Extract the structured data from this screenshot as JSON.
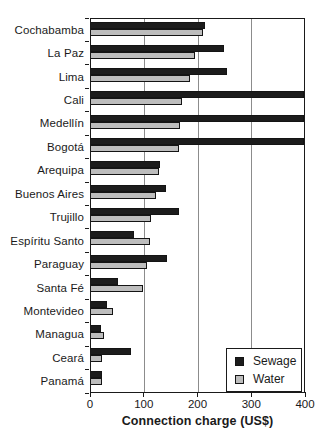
{
  "chart_data": {
    "type": "bar",
    "orientation": "horizontal",
    "title": "",
    "xlabel": "Connection charge (US$)",
    "ylabel": "",
    "xlim": [
      0,
      400
    ],
    "xticks": [
      0,
      100,
      200,
      300,
      400
    ],
    "grid": "vertical",
    "legend_position": "inside-bottom-right",
    "categories": [
      "Cochabamba",
      "La Paz",
      "Lima",
      "Cali",
      "Medellín",
      "Bogotá",
      "Arequipa",
      "Buenos Aires",
      "Trujillo",
      "Espíritu Santo",
      "Paraguay",
      "Santa Fé",
      "Montevideo",
      "Managua",
      "Ceará",
      "Panamá"
    ],
    "series": [
      {
        "name": "Sewage",
        "color": "#1c1c1c",
        "values": [
          215,
          250,
          255,
          400,
          400,
          400,
          130,
          140,
          165,
          80,
          143,
          50,
          30,
          18,
          75,
          20
        ]
      },
      {
        "name": "Water",
        "color": "#bdbdbd",
        "values": [
          210,
          195,
          185,
          170,
          168,
          165,
          128,
          122,
          113,
          110,
          105,
          98,
          42,
          25,
          20,
          20
        ]
      }
    ]
  },
  "legend": {
    "items": [
      {
        "label": "Sewage",
        "color": "#1c1c1c"
      },
      {
        "label": "Water",
        "color": "#bdbdbd"
      }
    ]
  },
  "axis": {
    "tick_labels": [
      "0",
      "100",
      "200",
      "300",
      "400"
    ]
  },
  "colors": {
    "sewage": "#1c1c1c",
    "water": "#bdbdbd",
    "gridline": "#8c8c8c",
    "axis": "#1a1a1a",
    "background": "#ffffff"
  }
}
